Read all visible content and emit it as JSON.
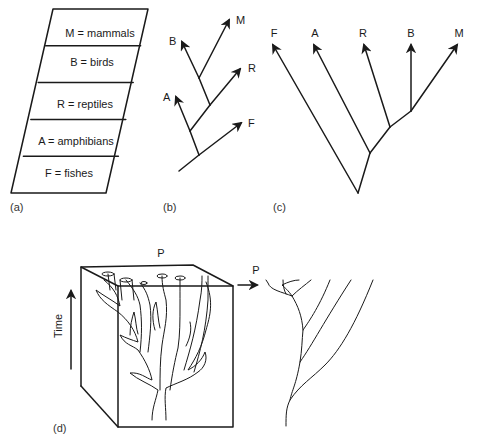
{
  "figure": {
    "panel_a": {
      "caption": "(a)",
      "rows": [
        {
          "label": "M = mammals"
        },
        {
          "label": "B = birds"
        },
        {
          "label": "R = reptiles"
        },
        {
          "label": "A = amphibians"
        },
        {
          "label": "F = fishes"
        }
      ]
    },
    "panel_b": {
      "caption": "(b)",
      "tips": {
        "M": "M",
        "B": "B",
        "R": "R",
        "A": "A",
        "F": "F"
      }
    },
    "panel_c": {
      "caption": "(c)",
      "tips": [
        "F",
        "A",
        "R",
        "B",
        "M"
      ]
    },
    "panel_d": {
      "caption": "(d)",
      "top_label": "P",
      "right_label": "P",
      "axis_label": "Time"
    }
  }
}
